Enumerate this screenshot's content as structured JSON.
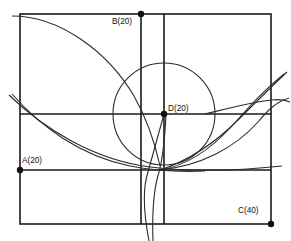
{
  "figure": {
    "background_color": "#ffffff",
    "line_color": "#1a1a1a",
    "curve_color": "#2b2b2b",
    "width": 291,
    "height": 241
  },
  "points": [
    {
      "id": "A",
      "label": "A(20)",
      "value": 20,
      "x": 20,
      "y": 170,
      "label_x": 22,
      "label_y": 163
    },
    {
      "id": "B",
      "label": "B(20)",
      "value": 20,
      "x": 141,
      "y": 14,
      "label_x": 112,
      "label_y": 24
    },
    {
      "id": "C",
      "label": "C(40)",
      "value": 40,
      "x": 271,
      "y": 224,
      "label_x": 238,
      "label_y": 213
    },
    {
      "id": "D",
      "label": "D(20)",
      "value": 20,
      "x": 164,
      "y": 114,
      "label_x": 168,
      "label_y": 111
    }
  ],
  "rectangle": {
    "left": 20,
    "top": 14,
    "right": 271,
    "bottom": 224
  },
  "grid_lines": {
    "verticals": [
      141,
      164
    ],
    "horizontals": [
      114,
      170
    ]
  },
  "circle": {
    "center_x": 164,
    "center_y": 114,
    "radius": 51
  },
  "curves": {
    "top_arc": "M 12,16 C 60,16 108,52 134,96 C 147,119 155,143 160,166",
    "descending_hyperbola": "M 12,94 C 40,126 80,156 130,166 C 150,170 180,172 205,171",
    "lower_sweep": "M 9,95 C 45,130 95,160 150,167 C 200,173 245,170 282,166",
    "cusp_loop_left": "M 149,241 C 144,215 142,190 148,172 C 152,158 158,136 164,114",
    "cusp_loop_right": "M 153,241 C 152,214 154,188 159,172 C 163,157 165,136 166,114",
    "rising_curve_a": "M 160,170 C 185,166 210,150 232,126 C 250,106 264,90 284,74",
    "rising_curve_b": "M 160,170 C 190,160 216,142 238,120 C 256,102 270,88 287,72",
    "right_flat_arc": "M 160,170 C 200,166 235,148 258,122 C 268,110 276,102 289,98",
    "far_right_tail": "M 205,114 C 230,108 252,102 272,100 C 280,99 285,100 290,102",
    "circle_chord_tail": "M 134,96 C 146,120 156,146 160,170"
  }
}
